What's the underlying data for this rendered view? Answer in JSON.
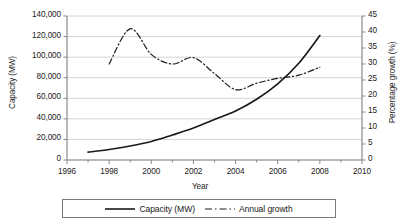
{
  "chart_data": {
    "type": "line",
    "title": "",
    "xlabel": "Year",
    "ylabel": "Capacity (MW)",
    "y2label": "Percentage growth (%)",
    "xlim": [
      1996,
      2010
    ],
    "ylim": [
      0,
      140000
    ],
    "y2lim": [
      0,
      45
    ],
    "grid": true,
    "legend_position": "bottom",
    "x_ticks": [
      1996,
      1998,
      2000,
      2002,
      2004,
      2006,
      2008,
      2010
    ],
    "x_tick_labels": [
      "1996",
      "1998",
      "2000",
      "2002",
      "2004",
      "2006",
      "2008",
      "2010"
    ],
    "x_minor_ticks": [
      1997,
      1999,
      2001,
      2003,
      2005,
      2007,
      2009
    ],
    "y_ticks": [
      0,
      20000,
      40000,
      60000,
      80000,
      100000,
      120000,
      140000
    ],
    "y_tick_labels": [
      "0",
      "20,000",
      "40,000",
      "60,000",
      "80,000",
      "100,000",
      "120,000",
      "140,000"
    ],
    "y2_ticks": [
      0,
      5,
      10,
      15,
      20,
      25,
      30,
      35,
      40,
      45
    ],
    "y2_tick_labels": [
      "0",
      "5",
      "10",
      "15",
      "20",
      "25",
      "30",
      "35",
      "40",
      "45"
    ],
    "series": [
      {
        "name": "Capacity (MW)",
        "axis": "left",
        "style": "solid",
        "color": "#1a1a1a",
        "x": [
          1997,
          1998,
          1999,
          2000,
          2001,
          2002,
          2003,
          2004,
          2005,
          2006,
          2007,
          2008
        ],
        "values": [
          7600,
          10200,
          13600,
          18000,
          24300,
          31100,
          39400,
          47600,
          59000,
          74000,
          94000,
          121000
        ]
      },
      {
        "name": "Annual growth",
        "axis": "right",
        "style": "dash-dot",
        "color": "#1a1a1a",
        "x": [
          1998,
          1999,
          2000,
          2001,
          2002,
          2003,
          2004,
          2005,
          2006,
          2007,
          2008
        ],
        "values": [
          30.0,
          41.0,
          33.0,
          30.0,
          32.0,
          27.0,
          22.0,
          24.0,
          25.5,
          26.5,
          29.0
        ]
      }
    ]
  },
  "legend": {
    "entries": [
      {
        "label": "Capacity (MW)",
        "style": "solid"
      },
      {
        "label": "Annual growth",
        "style": "dash-dot"
      }
    ]
  }
}
